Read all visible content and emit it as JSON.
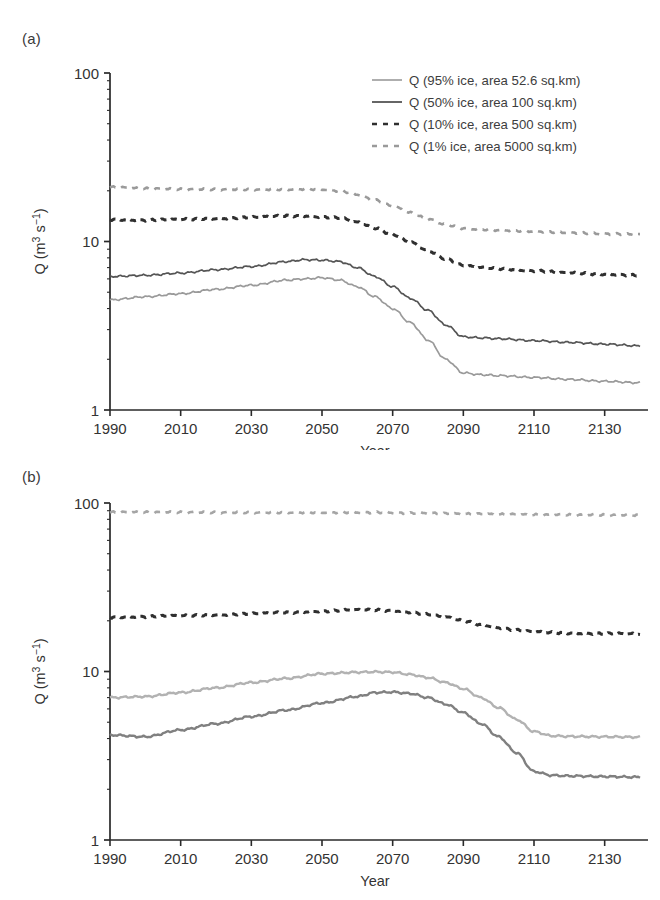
{
  "figure": {
    "panel_a_label": "(a)",
    "panel_b_label": "(b)"
  },
  "legend": {
    "position": "top-right of panel (a)",
    "entries": [
      {
        "label": "Q (95% ice, area 52.6 sq.km)",
        "style": "solid",
        "color": "#9a9a9a",
        "width": 1.6
      },
      {
        "label": "Q (50% ice, area 100 sq.km)",
        "style": "solid",
        "color": "#555555",
        "width": 1.8
      },
      {
        "label": "Q (10% ice, area 500 sq.km)",
        "style": "dashed",
        "color": "#2f2f2f",
        "width": 2.6
      },
      {
        "label": "Q (1% ice, area 5000 sq.km)",
        "style": "dashed",
        "color": "#9a9a9a",
        "width": 2.4
      }
    ]
  },
  "axes": {
    "y_label": "Q (m",
    "y_label_sup": "3",
    "y_label_mid": " s",
    "y_label_sup2": "−1",
    "y_label_end": ")",
    "y_label_full": "Q (m3 s-1)",
    "x_label": "Year",
    "y_ticks": [
      "1",
      "10",
      "100"
    ],
    "y_tick_values": [
      1,
      10,
      100
    ],
    "x_ticks": [
      "1990",
      "2010",
      "2030",
      "2050",
      "2070",
      "2090",
      "2110",
      "2130"
    ],
    "x_tick_values": [
      1990,
      2010,
      2030,
      2050,
      2070,
      2090,
      2110,
      2130
    ],
    "y_scale": "log",
    "ylim": [
      1,
      100
    ],
    "xlim": [
      1990,
      2140
    ]
  },
  "chart_data": [
    {
      "type": "line",
      "panel": "(a)",
      "title": "",
      "xlabel": "Year",
      "ylabel": "Q (m3 s-1)",
      "yscale": "log",
      "ylim": [
        1,
        100
      ],
      "xlim": [
        1990,
        2140
      ],
      "grid": false,
      "legend_position": "upper right",
      "x": [
        1990,
        2000,
        2010,
        2020,
        2030,
        2040,
        2045,
        2050,
        2055,
        2060,
        2065,
        2070,
        2075,
        2080,
        2085,
        2090,
        2095,
        2100,
        2110,
        2120,
        2130,
        2140
      ],
      "series": [
        {
          "name": "Q (95% ice, area 52.6 sq.km)",
          "style": "solid",
          "color": "#9a9a9a",
          "values": [
            4.5,
            4.7,
            4.9,
            5.2,
            5.5,
            5.9,
            6.0,
            6.1,
            5.9,
            5.4,
            4.7,
            4.0,
            3.3,
            2.6,
            2.0,
            1.66,
            1.62,
            1.6,
            1.56,
            1.52,
            1.48,
            1.45
          ]
        },
        {
          "name": "Q (50% ice, area 100 sq.km)",
          "style": "solid",
          "color": "#555555",
          "values": [
            6.2,
            6.3,
            6.5,
            6.8,
            7.1,
            7.6,
            7.8,
            7.75,
            7.6,
            7.0,
            6.2,
            5.4,
            4.6,
            3.9,
            3.2,
            2.72,
            2.68,
            2.65,
            2.58,
            2.52,
            2.46,
            2.4
          ]
        },
        {
          "name": "Q (10% ice, area 500 sq.km)",
          "style": "dashed",
          "color": "#2f2f2f",
          "values": [
            13.5,
            13.4,
            13.5,
            13.7,
            13.9,
            14.2,
            14.2,
            14.0,
            13.8,
            13.0,
            12.0,
            11.0,
            9.9,
            8.8,
            7.9,
            7.2,
            7.0,
            6.9,
            6.7,
            6.5,
            6.4,
            6.3
          ]
        },
        {
          "name": "Q (1% ice, area 5000 sq.km)",
          "style": "dashed",
          "color": "#9a9a9a",
          "values": [
            21.0,
            20.6,
            20.4,
            20.4,
            20.4,
            20.4,
            20.5,
            20.4,
            20.0,
            19.0,
            17.6,
            16.2,
            14.8,
            13.6,
            12.6,
            12.0,
            11.8,
            11.7,
            11.5,
            11.3,
            11.1,
            11.0
          ]
        }
      ]
    },
    {
      "type": "line",
      "panel": "(b)",
      "title": "",
      "xlabel": "Year",
      "ylabel": "Q (m3 s-1)",
      "yscale": "log",
      "ylim": [
        1,
        100
      ],
      "xlim": [
        1990,
        2140
      ],
      "grid": false,
      "legend_position": "none",
      "x": [
        1990,
        2000,
        2010,
        2020,
        2030,
        2040,
        2050,
        2060,
        2065,
        2070,
        2075,
        2080,
        2085,
        2090,
        2095,
        2100,
        2105,
        2110,
        2115,
        2120,
        2130,
        2140
      ],
      "series": [
        {
          "name": "Q (95% ice, area 52.6 sq.km)",
          "style": "solid",
          "color": "#b2b2b2",
          "values": [
            7.0,
            7.1,
            7.5,
            8.0,
            8.6,
            9.1,
            9.7,
            9.9,
            9.95,
            9.9,
            9.6,
            9.2,
            8.6,
            7.9,
            7.0,
            6.1,
            5.2,
            4.4,
            4.15,
            4.12,
            4.1,
            4.08
          ]
        },
        {
          "name": "Q (50% ice, area 100 sq.km)",
          "style": "solid",
          "color": "#808080",
          "values": [
            4.2,
            4.1,
            4.5,
            4.9,
            5.4,
            5.9,
            6.5,
            7.1,
            7.5,
            7.55,
            7.4,
            7.0,
            6.4,
            5.7,
            4.9,
            4.1,
            3.3,
            2.55,
            2.42,
            2.4,
            2.38,
            2.36
          ]
        },
        {
          "name": "Q (10% ice, area 500 sq.km)",
          "style": "dashed",
          "color": "#2f2f2f",
          "values": [
            21.0,
            21.2,
            21.4,
            21.7,
            22.0,
            22.4,
            22.8,
            23.2,
            23.2,
            23.0,
            22.5,
            21.8,
            21.0,
            20.0,
            19.0,
            18.2,
            17.6,
            17.2,
            17.0,
            16.9,
            16.8,
            16.7
          ]
        },
        {
          "name": "Q (1% ice, area 5000 sq.km)",
          "style": "dashed",
          "color": "#a5a5a5",
          "values": [
            88.0,
            88.0,
            88.0,
            88.0,
            88.0,
            88.0,
            88.0,
            88.0,
            88.0,
            87.5,
            87.0,
            87.0,
            86.5,
            86.0,
            86.0,
            85.5,
            85.5,
            85.0,
            85.0,
            85.0,
            85.0,
            85.0
          ]
        }
      ]
    }
  ]
}
